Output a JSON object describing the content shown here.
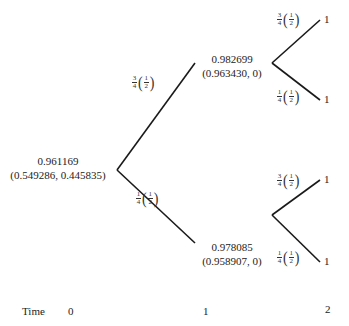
{
  "tree": {
    "root": {
      "value": "0.961169",
      "pair": "(0.549286, 0.445835)"
    },
    "up": {
      "value": "0.982699",
      "pair": "(0.963430, 0)"
    },
    "down": {
      "value": "0.978085",
      "pair": "(0.958907, 0)"
    },
    "leaves": {
      "uu": "1",
      "ud": "1",
      "du": "1",
      "dd": "1"
    },
    "edge_probs": {
      "root_up": {
        "num": "3",
        "den": "4",
        "inner_num": "1",
        "inner_den": "2"
      },
      "root_down": {
        "num": "1",
        "den": "4",
        "inner_num": "1",
        "inner_den": "2"
      },
      "up_up": {
        "num": "3",
        "den": "4",
        "inner_num": "1",
        "inner_den": "2"
      },
      "up_down": {
        "num": "1",
        "den": "4",
        "inner_num": "1",
        "inner_den": "2"
      },
      "down_up": {
        "num": "3",
        "den": "4",
        "inner_num": "1",
        "inner_den": "2"
      },
      "down_down": {
        "num": "1",
        "den": "4",
        "inner_num": "1",
        "inner_den": "2"
      }
    }
  },
  "time_axis": {
    "label": "Time",
    "ticks": [
      "0",
      "1",
      "2"
    ]
  },
  "colors": {
    "line": "#1a1a1a",
    "text": "#222222",
    "background": "#ffffff"
  }
}
